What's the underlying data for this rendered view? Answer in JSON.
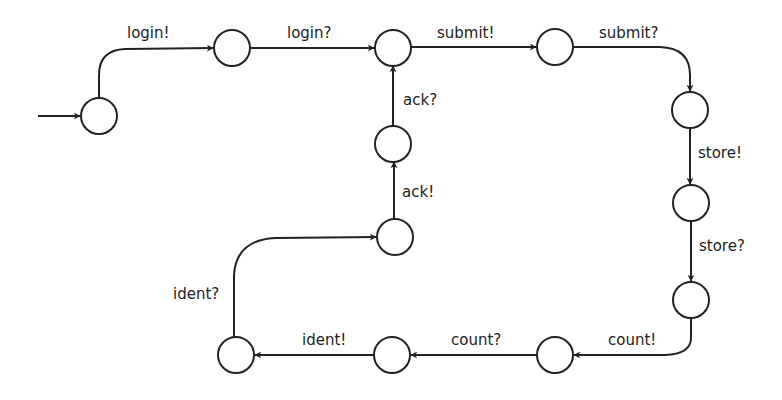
{
  "diagram": {
    "type": "state-machine",
    "stroke_color": "#222222",
    "background": "#ffffff",
    "states": [
      {
        "id": "s1",
        "initial": true
      },
      {
        "id": "s2"
      },
      {
        "id": "s3"
      },
      {
        "id": "s4"
      },
      {
        "id": "s5"
      },
      {
        "id": "s6"
      },
      {
        "id": "s7"
      },
      {
        "id": "s8"
      },
      {
        "id": "s9"
      },
      {
        "id": "s10"
      },
      {
        "id": "s11"
      },
      {
        "id": "s12"
      }
    ],
    "transitions": [
      {
        "from": "s1",
        "to": "s2",
        "label": "login!"
      },
      {
        "from": "s2",
        "to": "s3",
        "label": "login?"
      },
      {
        "from": "s3",
        "to": "s4",
        "label": "submit!"
      },
      {
        "from": "s4",
        "to": "s5",
        "label": "submit?"
      },
      {
        "from": "s5",
        "to": "s6",
        "label": "store!"
      },
      {
        "from": "s6",
        "to": "s7",
        "label": "store?"
      },
      {
        "from": "s7",
        "to": "s8",
        "label": "count!"
      },
      {
        "from": "s8",
        "to": "s9",
        "label": "count?"
      },
      {
        "from": "s9",
        "to": "s10",
        "label": "ident!"
      },
      {
        "from": "s10",
        "to": "s11",
        "label": "ident?"
      },
      {
        "from": "s11",
        "to": "s12",
        "label": "ack!"
      },
      {
        "from": "s12",
        "to": "s3",
        "label": "ack?"
      }
    ]
  }
}
